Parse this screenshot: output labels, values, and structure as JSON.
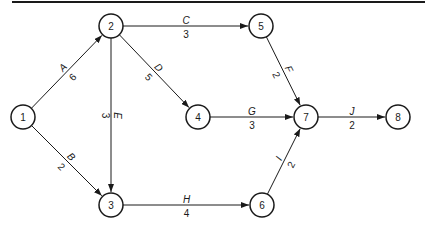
{
  "diagram": {
    "type": "activity-on-arrow network",
    "colors": {
      "stroke": "#1a1a1a",
      "background": "#ffffff"
    },
    "nodes": [
      {
        "id": "1",
        "label": "1",
        "x": 23,
        "y": 117
      },
      {
        "id": "2",
        "label": "2",
        "x": 111,
        "y": 26
      },
      {
        "id": "3",
        "label": "3",
        "x": 111,
        "y": 205
      },
      {
        "id": "4",
        "label": "4",
        "x": 198,
        "y": 117
      },
      {
        "id": "5",
        "label": "5",
        "x": 261,
        "y": 26
      },
      {
        "id": "6",
        "label": "6",
        "x": 262,
        "y": 205
      },
      {
        "id": "7",
        "label": "7",
        "x": 306,
        "y": 117
      },
      {
        "id": "8",
        "label": "8",
        "x": 398,
        "y": 117
      }
    ],
    "edges": [
      {
        "name": "A",
        "duration": "6",
        "from": "1",
        "to": "2"
      },
      {
        "name": "B",
        "duration": "2",
        "from": "1",
        "to": "3"
      },
      {
        "name": "C",
        "duration": "3",
        "from": "2",
        "to": "5"
      },
      {
        "name": "D",
        "duration": "5",
        "from": "2",
        "to": "4"
      },
      {
        "name": "E",
        "duration": "3",
        "from": "2",
        "to": "3"
      },
      {
        "name": "F",
        "duration": "2",
        "from": "5",
        "to": "7"
      },
      {
        "name": "G",
        "duration": "3",
        "from": "4",
        "to": "7"
      },
      {
        "name": "H",
        "duration": "4",
        "from": "3",
        "to": "6"
      },
      {
        "name": "I",
        "duration": "2",
        "from": "6",
        "to": "7"
      },
      {
        "name": "J",
        "duration": "2",
        "from": "7",
        "to": "8"
      }
    ]
  }
}
